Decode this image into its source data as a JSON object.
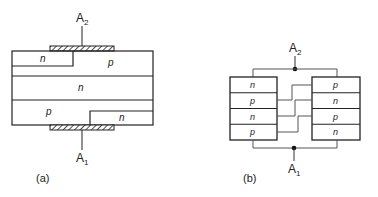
{
  "figure_a": {
    "caption": "(a)",
    "terminal_top": "A",
    "terminal_top_sub": "2",
    "terminal_bottom": "A",
    "terminal_bottom_sub": "1",
    "regions": {
      "top_left": "n",
      "top_right": "p",
      "middle": "n",
      "bottom_left": "p",
      "bottom_right": "n"
    }
  },
  "figure_b": {
    "caption": "(b)",
    "terminal_top": "A",
    "terminal_top_sub": "2",
    "terminal_bottom": "A",
    "terminal_bottom_sub": "1",
    "left_stack": [
      "n",
      "p",
      "n",
      "p"
    ],
    "right_stack": [
      "p",
      "n",
      "p",
      "n"
    ]
  },
  "colors": {
    "line": "#222222",
    "wire": "#555555",
    "background": "#ffffff"
  }
}
